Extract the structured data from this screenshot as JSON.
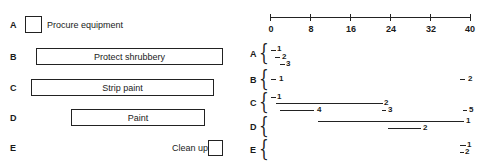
{
  "activities": [
    {
      "letter": "A",
      "label": "Procure equipment"
    },
    {
      "letter": "B",
      "label": "Protect shrubbery"
    },
    {
      "letter": "C",
      "label": "Strip paint"
    },
    {
      "letter": "D",
      "label": "Paint"
    },
    {
      "letter": "E",
      "label": "Clean up"
    }
  ],
  "axis": {
    "ticks": [
      "0",
      "8",
      "16",
      "24",
      "32",
      "40"
    ],
    "min": 0,
    "max": 40
  },
  "schedule": {
    "A": {
      "letter": "A",
      "items": [
        {
          "label": "1",
          "start": 0,
          "end": 1.5
        },
        {
          "label": "2",
          "start": 1.5,
          "end": 3
        },
        {
          "label": "3",
          "start": 3,
          "end": 4.5
        }
      ]
    },
    "B": {
      "letter": "B",
      "items": [
        {
          "label": "1",
          "start": 0,
          "end": 1.5
        },
        {
          "label": "2",
          "start": 37.5,
          "end": 39
        }
      ]
    },
    "C": {
      "letter": "C",
      "items": [
        {
          "label": "1",
          "start": 0,
          "end": 1.5
        },
        {
          "label": "2",
          "start": 0.5,
          "end": 22.5
        },
        {
          "label": "4",
          "start": 1,
          "end": 8.5
        },
        {
          "label": "3",
          "start": 22,
          "end": 23
        },
        {
          "label": "5",
          "start": 38,
          "end": 39
        }
      ]
    },
    "D": {
      "letter": "D",
      "items": [
        {
          "label": "1",
          "start": 9,
          "end": 39
        },
        {
          "label": "2",
          "start": 23.5,
          "end": 29.5
        }
      ]
    },
    "E": {
      "letter": "E",
      "items": [
        {
          "label": "1",
          "start": 37.5,
          "end": 39
        },
        {
          "label": "2",
          "start": 37.5,
          "end": 38.5
        }
      ]
    }
  }
}
